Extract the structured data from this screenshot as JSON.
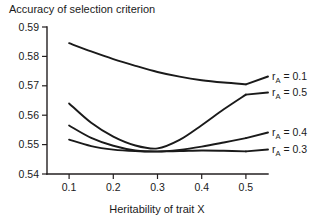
{
  "chart_data": {
    "type": "line",
    "title": "Accuracy of selection criterion",
    "xlabel": "Heritability of trait X",
    "ylabel": "",
    "xlim": [
      0.05,
      0.55
    ],
    "ylim": [
      0.54,
      0.59
    ],
    "xticks": [
      0.1,
      0.2,
      0.3,
      0.4,
      0.5
    ],
    "xticklabels": [
      "0.1",
      "0.2",
      "0.3",
      "0.4",
      "0.5"
    ],
    "yticks": [
      0.54,
      0.55,
      0.56,
      0.57,
      0.58,
      0.59
    ],
    "yticklabels": [
      "0.54",
      "0.55",
      "0.56",
      "0.57",
      "0.58",
      "0.59"
    ],
    "grid": false,
    "legend_position": "right-inline",
    "x": [
      0.1,
      0.15,
      0.2,
      0.25,
      0.3,
      0.35,
      0.4,
      0.45,
      0.5
    ],
    "series": [
      {
        "name": "rA = 0.1",
        "label_main": "r",
        "label_sub": "A",
        "label_rest": " = 0.1",
        "values": [
          0.5845,
          0.5817,
          0.5791,
          0.5768,
          0.5747,
          0.5731,
          0.5719,
          0.5711,
          0.5705
        ]
      },
      {
        "name": "rA = 0.5",
        "label_main": "r",
        "label_sub": "A",
        "label_rest": " = 0.5",
        "values": [
          0.564,
          0.5574,
          0.5527,
          0.5497,
          0.5487,
          0.5516,
          0.5566,
          0.562,
          0.567
        ]
      },
      {
        "name": "rA = 0.4",
        "label_main": "r",
        "label_sub": "A",
        "label_rest": " = 0.4",
        "values": [
          0.5565,
          0.5523,
          0.5496,
          0.548,
          0.5476,
          0.5482,
          0.5493,
          0.5507,
          0.5522
        ]
      },
      {
        "name": "rA = 0.3",
        "label_main": "r",
        "label_sub": "A",
        "label_rest": " = 0.3",
        "values": [
          0.5517,
          0.5495,
          0.5483,
          0.5478,
          0.5477,
          0.5478,
          0.548,
          0.5479,
          0.5477
        ]
      }
    ]
  }
}
